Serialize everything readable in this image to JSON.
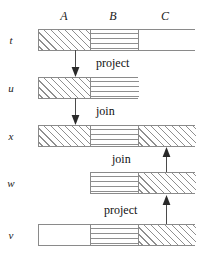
{
  "figure": {
    "stroke_color": "#8a8a8a",
    "text_color": "#111111"
  },
  "columns": [
    {
      "label": "A",
      "x": 64,
      "y": 9
    },
    {
      "label": "B",
      "x": 113,
      "y": 9
    },
    {
      "label": "C",
      "x": 165,
      "y": 9
    }
  ],
  "rows": [
    {
      "label": "t",
      "label_x": 10,
      "label_y": 34,
      "bar": {
        "x": 38,
        "y": 29,
        "width": 157,
        "height": 22
      },
      "segments": [
        {
          "name": "A",
          "left": 0,
          "width": 52,
          "fill": "hatch"
        },
        {
          "name": "B",
          "left": 52,
          "width": 48,
          "fill": "lines"
        },
        {
          "name": "C",
          "left": 100,
          "width": 57,
          "fill": "empty"
        }
      ]
    },
    {
      "label": "u",
      "label_x": 10,
      "label_y": 82,
      "bar": {
        "x": 38,
        "y": 77,
        "width": 100,
        "height": 22
      },
      "segments": [
        {
          "name": "A",
          "left": 0,
          "width": 52,
          "fill": "hatch"
        },
        {
          "name": "B",
          "left": 52,
          "width": 48,
          "fill": "lines"
        }
      ]
    },
    {
      "label": "x",
      "label_x": 10,
      "label_y": 130,
      "bar": {
        "x": 38,
        "y": 125,
        "width": 157,
        "height": 22
      },
      "segments": [
        {
          "name": "A",
          "left": 0,
          "width": 52,
          "fill": "hatch"
        },
        {
          "name": "B",
          "left": 52,
          "width": 48,
          "fill": "lines"
        },
        {
          "name": "C",
          "left": 100,
          "width": 57,
          "fill": "hatch"
        }
      ]
    },
    {
      "label": "w",
      "label_x": 10,
      "label_y": 177,
      "bar": {
        "x": 90,
        "y": 172,
        "width": 105,
        "height": 22
      },
      "segments": [
        {
          "name": "B",
          "left": 0,
          "width": 48,
          "fill": "lines"
        },
        {
          "name": "C",
          "left": 48,
          "width": 57,
          "fill": "hatch"
        }
      ]
    },
    {
      "label": "v",
      "label_x": 10,
      "label_y": 229,
      "bar": {
        "x": 38,
        "y": 224,
        "width": 157,
        "height": 22
      },
      "segments": [
        {
          "name": "A",
          "left": 0,
          "width": 52,
          "fill": "empty"
        },
        {
          "name": "B",
          "left": 52,
          "width": 48,
          "fill": "lines"
        },
        {
          "name": "C",
          "left": 100,
          "width": 57,
          "fill": "hatch"
        }
      ]
    }
  ],
  "arrows": [
    {
      "name": "t-to-u",
      "x": 75,
      "y1": 51,
      "y2": 76,
      "direction": "down"
    },
    {
      "name": "u-to-x",
      "x": 75,
      "y1": 99,
      "y2": 124,
      "direction": "down"
    },
    {
      "name": "w-to-x",
      "x": 166,
      "y1": 171,
      "y2": 148,
      "direction": "up"
    },
    {
      "name": "v-to-w",
      "x": 166,
      "y1": 223,
      "y2": 196,
      "direction": "up"
    }
  ],
  "operations": [
    {
      "label": "project",
      "x": 96,
      "y": 56
    },
    {
      "label": "join",
      "x": 96,
      "y": 104
    },
    {
      "label": "join",
      "x": 112,
      "y": 152
    },
    {
      "label": "project",
      "x": 104,
      "y": 203
    }
  ]
}
